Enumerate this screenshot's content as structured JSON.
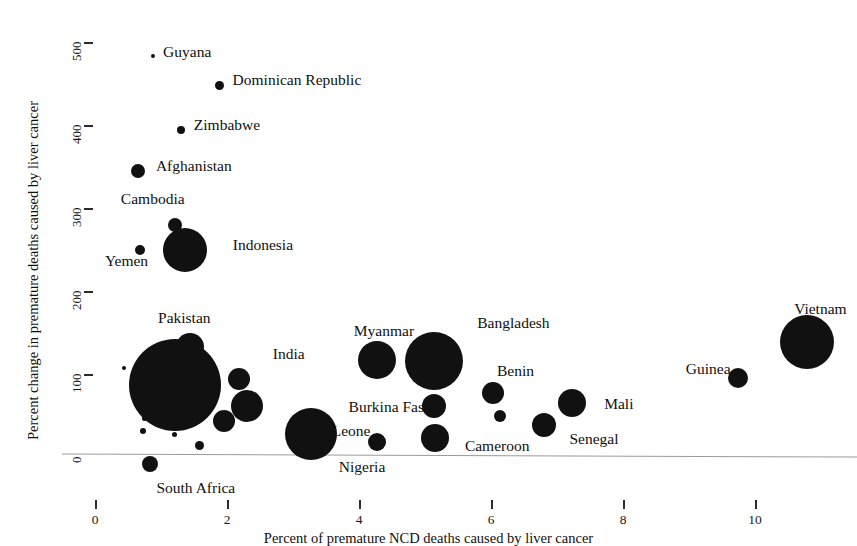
{
  "figure": {
    "partial_title_above": "",
    "background_color": "#ffffff",
    "marker_color": "#111111",
    "axis_color": "#9a9a9a"
  },
  "axes": {
    "x_title": "Percent of premature NCD deaths caused by liver cancer",
    "y_title": "Percent change in premature deaths caused by liver cancer",
    "x_ticks": [
      "0",
      "2",
      "4",
      "6",
      "8",
      "10"
    ],
    "y_ticks": [
      "0",
      "100",
      "200",
      "300",
      "400",
      "500"
    ]
  },
  "chart_data": {
    "type": "scatter",
    "title": "",
    "xlabel": "Percent of premature NCD deaths caused by liver cancer",
    "ylabel": "Percent change in premature deaths caused by liver cancer",
    "xlim": [
      0,
      11.5
    ],
    "ylim": [
      -30,
      520
    ],
    "xticks": [
      0,
      2,
      4,
      6,
      8,
      10
    ],
    "yticks": [
      0,
      100,
      200,
      300,
      400,
      500
    ],
    "grid": false,
    "legend": "none",
    "size_encodes": "number of premature deaths caused by liver cancer",
    "points": [
      {
        "label": "Guyana",
        "x": 0.88,
        "y": 483,
        "r": 2,
        "label_dx": 8,
        "label_dy": -6
      },
      {
        "label": "Dominican Republic",
        "x": 1.88,
        "y": 448,
        "r": 4.5,
        "label_dx": 9,
        "label_dy": -7
      },
      {
        "label": "Zimbabwe",
        "x": 1.3,
        "y": 394,
        "r": 4,
        "label_dx": 9,
        "label_dy": -7
      },
      {
        "label": "Afghanistan",
        "x": 0.65,
        "y": 344,
        "r": 7,
        "label_dx": 11,
        "label_dy": -7
      },
      {
        "label": "Cambodia",
        "x": 1.21,
        "y": 280,
        "r": 7,
        "label_dx": -61,
        "label_dy": -28
      },
      {
        "label": "Indonesia",
        "x": 1.36,
        "y": 249,
        "r": 22,
        "label_dx": 26,
        "label_dy": -7
      },
      {
        "label": "Yemen",
        "x": 0.68,
        "y": 250,
        "r": 5,
        "label_dx": -40,
        "label_dy": 9
      },
      {
        "label": "Pakistan",
        "x": 1.44,
        "y": 133,
        "r": 14,
        "label_dx": -46,
        "label_dy": -31
      },
      {
        "label": "India",
        "x": 1.21,
        "y": 87,
        "r": 46,
        "label_dx": 52,
        "label_dy": -33
      },
      {
        "label": "Nigeria",
        "x": 3.27,
        "y": 28,
        "r": 26,
        "label_dx": 2,
        "label_dy": 31
      },
      {
        "label": "South Africa",
        "x": 0.84,
        "y": -9,
        "r": 8,
        "label_dx": -2,
        "label_dy": 22
      },
      {
        "label": "Myanmar",
        "x": 4.27,
        "y": 117,
        "r": 19,
        "label_dx": -42,
        "label_dy": -31
      },
      {
        "label": "Bangladesh",
        "x": 5.14,
        "y": 116,
        "r": 29,
        "label_dx": 14,
        "label_dy": -40
      },
      {
        "label": "Benin",
        "x": 6.03,
        "y": 77,
        "r": 11,
        "label_dx": -7,
        "label_dy": -24
      },
      {
        "label": "Burkina Faso",
        "x": 5.13,
        "y": 62,
        "r": 12,
        "label_dx": -97,
        "label_dy": -1
      },
      {
        "label": "Sierra Leone",
        "x": 4.27,
        "y": 18,
        "r": 9,
        "label_dx": -95,
        "label_dy": -13
      },
      {
        "label": "Cameroon",
        "x": 5.15,
        "y": 23,
        "r": 14,
        "label_dx": 16,
        "label_dy": 6
      },
      {
        "label": "Senegal",
        "x": 6.81,
        "y": 38,
        "r": 12,
        "label_dx": 13,
        "label_dy": 12
      },
      {
        "label": "Mali",
        "x": 7.23,
        "y": 65,
        "r": 14,
        "label_dx": 18,
        "label_dy": -1
      },
      {
        "label": "Guinea",
        "x": 9.74,
        "y": 95,
        "r": 10,
        "label_dx": -62,
        "label_dy": -11
      },
      {
        "label": "Vietnam",
        "x": 10.79,
        "y": 139,
        "r": 27,
        "label_dx": -40,
        "label_dy": -35
      },
      {
        "label": "",
        "x": 0.44,
        "y": 107,
        "r": 2,
        "label_dx": 0,
        "label_dy": 0
      },
      {
        "label": "",
        "x": 0.75,
        "y": 46,
        "r": 2.5,
        "label_dx": 0,
        "label_dy": 0
      },
      {
        "label": "",
        "x": 0.72,
        "y": 31,
        "r": 3,
        "label_dx": 0,
        "label_dy": 0
      },
      {
        "label": "",
        "x": 1.21,
        "y": 27,
        "r": 2.5,
        "label_dx": 0,
        "label_dy": 0
      },
      {
        "label": "",
        "x": 1.59,
        "y": 14,
        "r": 4.5,
        "label_dx": 0,
        "label_dy": 0
      },
      {
        "label": "",
        "x": 6.14,
        "y": 50,
        "r": 6,
        "label_dx": 0,
        "label_dy": 0
      },
      {
        "label": "",
        "x": 2.3,
        "y": 62,
        "r": 16,
        "label_dx": 0,
        "label_dy": 0
      },
      {
        "label": "",
        "x": 2.18,
        "y": 94,
        "r": 11,
        "label_dx": 0,
        "label_dy": 0
      },
      {
        "label": "",
        "x": 1.95,
        "y": 43,
        "r": 11,
        "label_dx": 0,
        "label_dy": 0
      }
    ]
  }
}
